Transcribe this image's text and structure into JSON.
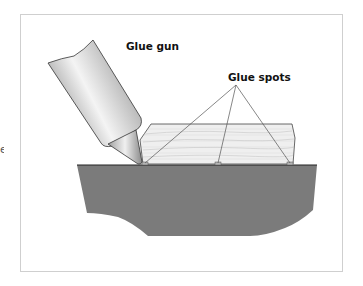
{
  "diagram": {
    "labels": {
      "glue_gun": "Glue gun",
      "glue_spots": "Glue spots"
    },
    "edge_fragment": "e",
    "colors": {
      "base": "#7b7b7b",
      "wood": "#efefef",
      "wood_grain": "#c4c4c4",
      "outline": "#222222",
      "leader": "#555555",
      "gun_light": "#f2f2f2",
      "gun_dark": "#9a9a9a",
      "frame": "#cfcfcf"
    },
    "glue_spots": [
      {
        "x": 145,
        "y": 164
      },
      {
        "x": 218,
        "y": 164
      },
      {
        "x": 290,
        "y": 164
      }
    ],
    "leader_apex": {
      "x": 236,
      "y": 85
    }
  }
}
